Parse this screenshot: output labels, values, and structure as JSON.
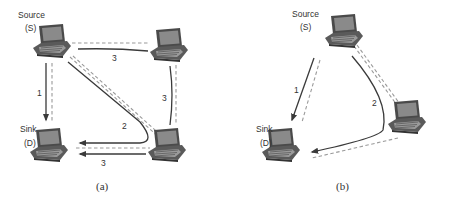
{
  "panels": [
    {
      "id": "a",
      "caption": "(a)",
      "nodes": [
        {
          "id": "source",
          "label_line1": "Source",
          "label_line2": "(S)"
        },
        {
          "id": "sink",
          "label_line1": "Sink",
          "label_line2": "(D)"
        },
        {
          "id": "top-right"
        },
        {
          "id": "bottom-right"
        }
      ],
      "paths": [
        {
          "label": "1",
          "route": "S→D"
        },
        {
          "label": "2",
          "route": "S→bottom-right→D"
        },
        {
          "label": "3",
          "route": "S→top-right"
        },
        {
          "label": "3",
          "route": "top-right→bottom-right"
        },
        {
          "label": "3",
          "route": "bottom-right→D"
        }
      ]
    },
    {
      "id": "b",
      "caption": "(b)",
      "nodes": [
        {
          "id": "source",
          "label_line1": "Source",
          "label_line2": "(S)"
        },
        {
          "id": "sink",
          "label_line1": "Sink",
          "label_line2": "(D)"
        },
        {
          "id": "right"
        }
      ],
      "paths": [
        {
          "label": "1",
          "route": "S→D"
        },
        {
          "label": "2",
          "route": "S→right→D"
        }
      ]
    }
  ],
  "colors": {
    "path": "#3a3a3a",
    "link": "#9a9a9a",
    "laptop": "#555555"
  }
}
